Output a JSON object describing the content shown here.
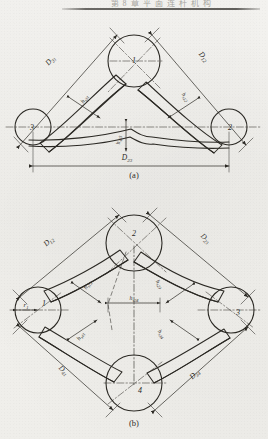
{
  "page": {
    "header_text": "第 8 章   平 面 连 杆 机 构",
    "background_color": "#f3f2ee",
    "ink_color": "#2b2924"
  },
  "figures": [
    {
      "id": "figure-a",
      "caption": "(a)",
      "type": "three-joint-mechanism",
      "joints": [
        {
          "label": "1",
          "cx": 134,
          "cy": 61,
          "r": 26
        },
        {
          "label": "3",
          "cx": 33,
          "cy": 127,
          "r": 18
        },
        {
          "label": "2",
          "cx": 229,
          "cy": 127,
          "r": 18
        }
      ],
      "dimensions": [
        {
          "label": "D31",
          "base": "D",
          "sub": "31",
          "x": 52,
          "y": 62,
          "rotate": -35
        },
        {
          "label": "D12",
          "base": "D",
          "sub": "12",
          "x": 200,
          "y": 58,
          "rotate": 35
        },
        {
          "label": "D23",
          "base": "D",
          "sub": "23",
          "x": 127,
          "y": 158,
          "rotate": 0
        }
      ],
      "thicknesses": [
        {
          "label": "hs31",
          "base": "h",
          "sub": "s31",
          "x": 85,
          "y": 96,
          "rotate": -56
        },
        {
          "label": "hs12",
          "base": "h",
          "sub": "s12",
          "x": 183,
          "y": 92,
          "rotate": 56
        },
        {
          "label": "hs23",
          "base": "h",
          "sub": "s23",
          "x": 118,
          "y": 140,
          "rotate": -90
        }
      ]
    },
    {
      "id": "figure-b",
      "caption": "(b)",
      "type": "four-joint-mechanism",
      "joints": [
        {
          "label": "2",
          "cx": 134,
          "cy": 243,
          "r": 28
        },
        {
          "label": "1",
          "cx": 38,
          "cy": 310,
          "r": 23
        },
        {
          "label": "3",
          "cx": 231,
          "cy": 310,
          "r": 23
        },
        {
          "label": "4",
          "cx": 134,
          "cy": 383,
          "r": 28
        }
      ],
      "dimensions": [
        {
          "label": "D12",
          "base": "D",
          "sub": "12",
          "x": 48,
          "y": 240,
          "rotate": -36
        },
        {
          "label": "D23",
          "base": "D",
          "sub": "23",
          "x": 203,
          "y": 238,
          "rotate": 35
        },
        {
          "label": "D41",
          "base": "D",
          "sub": "41",
          "x": 63,
          "y": 372,
          "rotate": 60
        },
        {
          "label": "D34",
          "base": "D",
          "sub": "34",
          "x": 193,
          "y": 381,
          "rotate": -59
        }
      ],
      "thicknesses": [
        {
          "label": "hs12",
          "base": "h",
          "sub": "s12",
          "x": 88,
          "y": 282,
          "rotate": -60
        },
        {
          "label": "hs23",
          "base": "h",
          "sub": "s23",
          "x": 157,
          "y": 280,
          "rotate": 60
        },
        {
          "label": "hs24",
          "base": "h",
          "sub": "s24",
          "x": 133,
          "y": 296,
          "rotate": 0
        },
        {
          "label": "hs41",
          "base": "h",
          "sub": "s41",
          "x": 81,
          "y": 336,
          "rotate": -56
        },
        {
          "label": "hs34",
          "base": "h",
          "sub": "s34",
          "x": 160,
          "y": 336,
          "rotate": 58
        }
      ],
      "radii": [
        {
          "label": "r1",
          "base": "r",
          "sub": "1",
          "x": 30,
          "y": 308
        }
      ]
    }
  ]
}
